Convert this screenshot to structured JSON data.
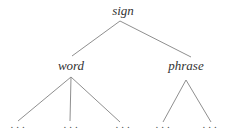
{
  "figure": {
    "background": "#ffffff",
    "line_color": "#8f8f8f",
    "text_color": "#333333",
    "tree": {
      "root": {
        "label": "sign"
      },
      "branches": [
        {
          "label": "word",
          "leaves": [
            "...",
            "...",
            "..."
          ]
        },
        {
          "label": "phrase",
          "leaves": [
            "...",
            "..."
          ]
        }
      ]
    }
  }
}
